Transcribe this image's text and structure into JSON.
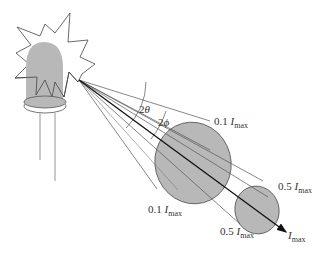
{
  "figure": {
    "colors": {
      "fill_gray": "#b8b8b8",
      "stroke": "#444444",
      "axis": "#111111",
      "leads": "#bdbdbd"
    },
    "angles": {
      "outer": {
        "prefix": "2",
        "symbol": "θ"
      },
      "inner": {
        "prefix": "2",
        "symbol": "ϕ"
      }
    },
    "labels": {
      "outer_top": {
        "value": "0.1",
        "symbol": "I",
        "sub": "max"
      },
      "outer_bottom": {
        "value": "0.1",
        "symbol": "I",
        "sub": "max"
      },
      "inner_top": {
        "value": "0.5",
        "symbol": "I",
        "sub": "max"
      },
      "inner_bottom": {
        "value": "0.5",
        "symbol": "I",
        "sub": "max"
      },
      "axis": {
        "value": "",
        "symbol": "I",
        "sub": "max"
      }
    }
  }
}
